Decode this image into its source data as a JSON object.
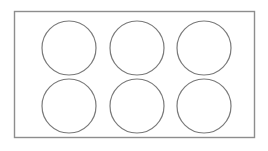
{
  "diagram": {
    "canvas": {
      "width": 268,
      "height": 151,
      "background_color": "#ffffff"
    },
    "tray": {
      "label": "tray-outline",
      "shape": "rectangle",
      "x": 14.5,
      "y": 11.5,
      "width": 240,
      "height": 126,
      "stroke_color": "#8d8d8d",
      "stroke_width": 1.4,
      "fill_color": "#ffffff"
    },
    "cavities": {
      "label": "cavity",
      "shape": "circle",
      "count": 6,
      "rows": 2,
      "columns": 3,
      "radius": 27,
      "stroke_color": "#7a7a7a",
      "stroke_width": 1.2,
      "fill_color": "#ffffff",
      "items": [
        {
          "id": "cavity-1",
          "row": 1,
          "column": 1,
          "cx": 69,
          "cy": 48
        },
        {
          "id": "cavity-2",
          "row": 1,
          "column": 2,
          "cx": 137,
          "cy": 48
        },
        {
          "id": "cavity-3",
          "row": 1,
          "column": 3,
          "cx": 204,
          "cy": 48
        },
        {
          "id": "cavity-4",
          "row": 2,
          "column": 1,
          "cx": 69,
          "cy": 106
        },
        {
          "id": "cavity-5",
          "row": 2,
          "column": 2,
          "cx": 137,
          "cy": 106
        },
        {
          "id": "cavity-6",
          "row": 2,
          "column": 3,
          "cx": 204,
          "cy": 106
        }
      ]
    }
  }
}
